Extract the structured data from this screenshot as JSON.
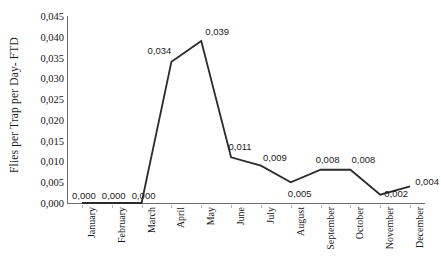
{
  "chart_data": {
    "type": "line",
    "title": "",
    "subtitle": "",
    "xlabel": "",
    "ylabel": "Flies per Trap per Day- FTD",
    "categories": [
      "January",
      "February",
      "March",
      "April",
      "May",
      "June",
      "July",
      "August",
      "September",
      "October",
      "November",
      "December"
    ],
    "values": [
      0.0,
      0.0,
      0.0,
      0.034,
      0.039,
      0.011,
      0.009,
      0.005,
      0.008,
      0.008,
      0.002,
      0.004
    ],
    "point_labels": [
      "0,000",
      "0,000",
      "0,000",
      "0,034",
      "0,039",
      "0,011",
      "0,009",
      "0,005",
      "0,008",
      "0,008",
      "0,002",
      "0,004"
    ],
    "ylim": [
      0.0,
      0.045
    ],
    "ytick_values": [
      0.0,
      0.005,
      0.01,
      0.015,
      0.02,
      0.025,
      0.03,
      0.035,
      0.04,
      0.045
    ],
    "ytick_labels": [
      "0,000",
      "0,005",
      "0,010",
      "0,015",
      "0,020",
      "0,025",
      "0,030",
      "0,035",
      "0,040",
      "0,045"
    ],
    "grid": false,
    "legend": false,
    "legend_position": "none",
    "decimal_separator": ",",
    "markers": false,
    "series": [
      {
        "name": "FTD",
        "values": [
          0.0,
          0.0,
          0.0,
          0.034,
          0.039,
          0.011,
          0.009,
          0.005,
          0.008,
          0.008,
          0.002,
          0.004
        ],
        "color": "#2b2b2b"
      }
    ],
    "colors": {
      "line": "#2b2b2b",
      "axis": "#6d6d6d",
      "text": "#141414",
      "background": "#ffffff"
    }
  }
}
